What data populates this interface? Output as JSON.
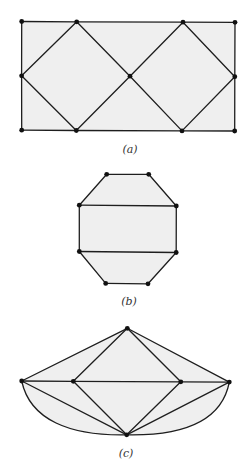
{
  "figures": [
    {
      "id": "a",
      "caption": "(a)",
      "description": "Rectangle with two inscribed diamonds sharing a central vertex",
      "vertices": [
        "TL",
        "T1",
        "T3",
        "TR",
        "ML",
        "C",
        "MR",
        "BL",
        "B1",
        "B3",
        "BR"
      ],
      "edges": [
        [
          "TL",
          "T1"
        ],
        [
          "T1",
          "T3"
        ],
        [
          "T3",
          "TR"
        ],
        [
          "BL",
          "B1"
        ],
        [
          "B1",
          "B3"
        ],
        [
          "B3",
          "BR"
        ],
        [
          "TL",
          "ML"
        ],
        [
          "ML",
          "BL"
        ],
        [
          "TR",
          "MR"
        ],
        [
          "MR",
          "BR"
        ],
        [
          "ML",
          "T1"
        ],
        [
          "T1",
          "C"
        ],
        [
          "C",
          "B1"
        ],
        [
          "B1",
          "ML"
        ],
        [
          "C",
          "T3"
        ],
        [
          "T3",
          "MR"
        ],
        [
          "MR",
          "B3"
        ],
        [
          "B3",
          "C"
        ]
      ],
      "curved_edges": []
    },
    {
      "id": "b",
      "caption": "(b)",
      "description": "Octagon divided by two horizontal chords",
      "vertices": [
        "P1",
        "P2",
        "P3",
        "P4",
        "P5",
        "P6",
        "P7",
        "P8"
      ],
      "edges": [
        [
          "P1",
          "P2"
        ],
        [
          "P2",
          "P4"
        ],
        [
          "P4",
          "P6"
        ],
        [
          "P6",
          "P8"
        ],
        [
          "P8",
          "P7"
        ],
        [
          "P7",
          "P5"
        ],
        [
          "P5",
          "P3"
        ],
        [
          "P3",
          "P1"
        ],
        [
          "P3",
          "P4"
        ],
        [
          "P5",
          "P6"
        ]
      ],
      "curved_edges": []
    },
    {
      "id": "c",
      "caption": "(c)",
      "description": "Graph with apex, four collinear middle vertices, and bottom vertex with two curved edges",
      "vertices": [
        "TOP",
        "LO",
        "LI",
        "RI",
        "RO",
        "BOT"
      ],
      "edges": [
        [
          "TOP",
          "LO"
        ],
        [
          "TOP",
          "LI"
        ],
        [
          "TOP",
          "RI"
        ],
        [
          "TOP",
          "RO"
        ],
        [
          "LO",
          "LI"
        ],
        [
          "LI",
          "RI"
        ],
        [
          "RI",
          "RO"
        ],
        [
          "LO",
          "BOT"
        ],
        [
          "LI",
          "BOT"
        ],
        [
          "RI",
          "BOT"
        ],
        [
          "RO",
          "BOT"
        ]
      ],
      "curved_edges": [
        [
          "LO",
          "BOT"
        ],
        [
          "RO",
          "BOT"
        ]
      ]
    }
  ]
}
